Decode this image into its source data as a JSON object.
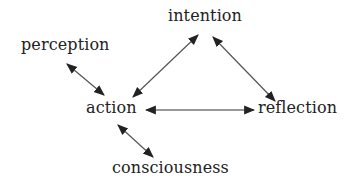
{
  "diagram": {
    "nodes": [
      {
        "id": "perception",
        "label": "perception"
      },
      {
        "id": "intention",
        "label": "intention"
      },
      {
        "id": "action",
        "label": "action"
      },
      {
        "id": "reflection",
        "label": "reflection"
      },
      {
        "id": "consciousness",
        "label": "consciousness"
      }
    ],
    "edges": [
      {
        "from": "perception",
        "to": "action",
        "direction": "bidirectional"
      },
      {
        "from": "intention",
        "to": "action",
        "direction": "bidirectional"
      },
      {
        "from": "intention",
        "to": "reflection",
        "direction": "bidirectional"
      },
      {
        "from": "action",
        "to": "reflection",
        "direction": "bidirectional"
      },
      {
        "from": "action",
        "to": "consciousness",
        "direction": "bidirectional"
      }
    ],
    "colors": {
      "text": "#222222",
      "line": "#555555",
      "arrowhead": "#222222",
      "background": "#ffffff"
    }
  }
}
